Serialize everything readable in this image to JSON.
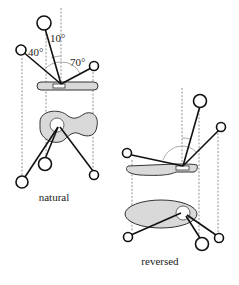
{
  "diagram": {
    "angle_labels": {
      "top": "10°",
      "left": "40°",
      "right": "70°"
    },
    "captions": {
      "left": "natural",
      "right": "reversed"
    },
    "colors": {
      "line": "#111111",
      "fill": "#d9d9d9",
      "dashed": "#777777",
      "background": "#ffffff"
    }
  }
}
